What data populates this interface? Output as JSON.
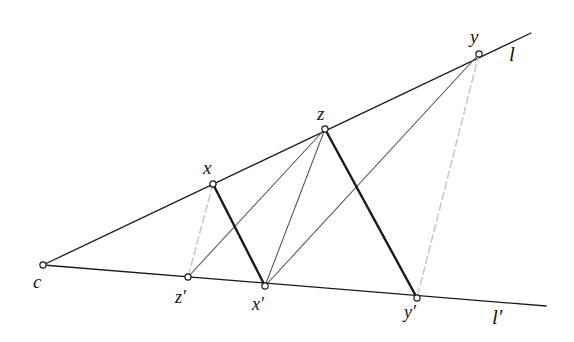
{
  "figure": {
    "background_color": "#ffffff",
    "width": 574,
    "height": 342,
    "colors": {
      "solid_dark": "#1a1a1a",
      "thin_gray": "#5a5a5a",
      "dashed_light": "#c9c9c9",
      "marker_stroke": "#1a1a1a",
      "marker_fill": "#ffffff",
      "label_color": "#141414"
    },
    "points": [
      {
        "id": "c",
        "label": "c",
        "x": 43,
        "y": 265,
        "label_x": 33,
        "label_y": 272
      },
      {
        "id": "x",
        "label": "x",
        "x": 213,
        "y": 184,
        "label_x": 203,
        "label_y": 158
      },
      {
        "id": "z",
        "label": "z",
        "x": 325,
        "y": 129,
        "label_x": 317,
        "label_y": 104
      },
      {
        "id": "y",
        "label": "y",
        "x": 479,
        "y": 54,
        "label_x": 470,
        "label_y": 27
      },
      {
        "id": "zp",
        "label": "z′",
        "x": 188,
        "y": 277,
        "label_x": 175,
        "label_y": 288
      },
      {
        "id": "xp",
        "label": "x′",
        "x": 265,
        "y": 286,
        "label_x": 252,
        "label_y": 295
      },
      {
        "id": "yp",
        "label": "y′",
        "x": 417,
        "y": 298,
        "label_x": 404,
        "label_y": 303
      }
    ],
    "line_labels": [
      {
        "id": "l",
        "label": "l",
        "x": 509,
        "y": 44
      },
      {
        "id": "lprime",
        "label": "l′",
        "x": 492,
        "y": 307
      }
    ],
    "lines": [
      {
        "id": "line-l",
        "from": "c",
        "to": "l-end",
        "style": "solid-dark",
        "x1": 43,
        "y1": 265,
        "x2": 531,
        "y2": 33,
        "width": 1.3
      },
      {
        "id": "line-l-prime",
        "from": "c",
        "to": "lp-end",
        "style": "solid-dark",
        "x1": 43,
        "y1": 265,
        "x2": 546,
        "y2": 306,
        "width": 1.3
      }
    ],
    "segments": [
      {
        "id": "seg-x-xprime",
        "from": "x",
        "to": "xp",
        "style": "thick-dark",
        "x1": 213,
        "y1": 184,
        "x2": 265,
        "y2": 286,
        "width": 2.3
      },
      {
        "id": "seg-z-yprime",
        "from": "z",
        "to": "yp",
        "style": "thick-dark",
        "x1": 325,
        "y1": 129,
        "x2": 417,
        "y2": 298,
        "width": 2.3
      },
      {
        "id": "seg-z-xprime",
        "from": "z",
        "to": "xp",
        "style": "thin-gray",
        "x1": 325,
        "y1": 129,
        "x2": 265,
        "y2": 286,
        "width": 1.1
      },
      {
        "id": "seg-zprime-z",
        "from": "zp",
        "to": "z",
        "style": "thin-gray",
        "x1": 188,
        "y1": 277,
        "x2": 325,
        "y2": 129,
        "width": 1.1
      },
      {
        "id": "seg-xprime-y",
        "from": "xp",
        "to": "y",
        "style": "thin-gray",
        "x1": 265,
        "y1": 286,
        "x2": 479,
        "y2": 54,
        "width": 1.1
      },
      {
        "id": "seg-x-zprime",
        "from": "x",
        "to": "zp",
        "style": "dashed-light",
        "x1": 213,
        "y1": 184,
        "x2": 188,
        "y2": 277,
        "width": 1.6
      },
      {
        "id": "seg-y-yprime",
        "from": "y",
        "to": "yp",
        "style": "dashed-light",
        "x1": 479,
        "y1": 54,
        "x2": 417,
        "y2": 298,
        "width": 1.6
      }
    ]
  }
}
